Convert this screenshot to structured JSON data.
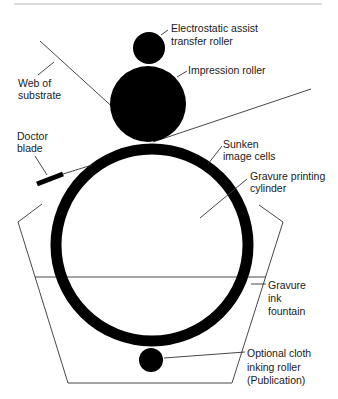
{
  "diagram": {
    "colors": {
      "ink": "#000000",
      "line": "#333333",
      "text": "#1a1a1a",
      "background": "#ffffff",
      "rule": "#b5b5b5"
    },
    "labels": {
      "electrostatic": {
        "line1": "Electrostatic assist",
        "line2": "transfer roller"
      },
      "impression": {
        "line1": "Impression roller"
      },
      "web": {
        "line1": "Web of",
        "line2": "substrate"
      },
      "doctor": {
        "line1": "Doctor",
        "line2": "blade"
      },
      "sunken": {
        "line1": "Sunken",
        "line2": "image cells"
      },
      "cylinder": {
        "line1": "Gravure printing",
        "line2": "cylinder"
      },
      "fountain": {
        "line1": "Gravure",
        "line2": "ink",
        "line3": "fountain"
      },
      "cloth": {
        "line1": "Optional cloth",
        "line2": "inking roller",
        "line3": "(Publication)"
      }
    },
    "components": [
      "Electrostatic assist transfer roller",
      "Impression roller",
      "Web of substrate",
      "Doctor blade",
      "Sunken image cells",
      "Gravure printing cylinder",
      "Gravure ink fountain",
      "Optional cloth inking roller (Publication)"
    ]
  }
}
